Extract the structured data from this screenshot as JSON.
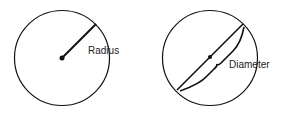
{
  "figures": [
    {
      "name": "radius-figure",
      "label": "Radius"
    },
    {
      "name": "diameter-figure",
      "label": "Diameter"
    }
  ],
  "colors": {
    "stroke": "#111111",
    "background": "#ffffff"
  }
}
